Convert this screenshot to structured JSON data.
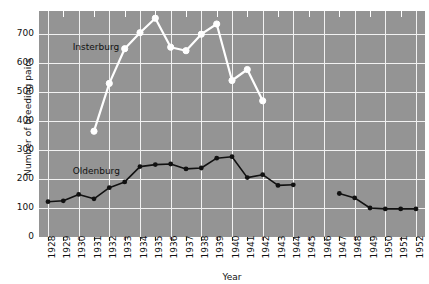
{
  "chart_data": {
    "type": "line",
    "title": "",
    "xlabel": "Year",
    "ylabel": "Number of breeding pairs",
    "xlim": [
      1928,
      1952
    ],
    "ylim": [
      0,
      780
    ],
    "yticks": [
      0,
      100,
      200,
      300,
      400,
      500,
      600,
      700
    ],
    "xticks": [
      1928,
      1929,
      1930,
      1931,
      1932,
      1933,
      1934,
      1935,
      1936,
      1937,
      1938,
      1939,
      1940,
      1941,
      1942,
      1943,
      1944,
      1945,
      1946,
      1947,
      1948,
      1949,
      1950,
      1951,
      1952
    ],
    "grid": true,
    "legend_position": "inline-annotation",
    "plot_background": "#949494",
    "gridline_color": "#f2f2f2",
    "series": [
      {
        "name": "Insterburg",
        "color": "#ffffff",
        "marker": "circle",
        "label_x": 1930,
        "label_y": 655,
        "x": [
          1931,
          1932,
          1933,
          1934,
          1935,
          1936,
          1937,
          1938,
          1939,
          1940,
          1941,
          1942,
          1943
        ],
        "values": [
          365,
          530,
          650,
          705,
          755,
          655,
          643,
          700,
          735,
          540,
          578,
          470,
          null
        ],
        "points": [
          {
            "year": 1931,
            "value": 365
          },
          {
            "year": 1932,
            "value": 530
          },
          {
            "year": 1933,
            "value": 650
          },
          {
            "year": 1934,
            "value": 705
          },
          {
            "year": 1935,
            "value": 755
          },
          {
            "year": 1936,
            "value": 655
          },
          {
            "year": 1937,
            "value": 643
          },
          {
            "year": 1938,
            "value": 700
          },
          {
            "year": 1939,
            "value": 735
          },
          {
            "year": 1940,
            "value": 540
          },
          {
            "year": 1941,
            "value": 578
          },
          {
            "year": 1942,
            "value": 470
          }
        ]
      },
      {
        "name": "Oldenburg",
        "color": "#111111",
        "marker": "dot",
        "label_x": 1930,
        "label_y": 228,
        "points": [
          {
            "year": 1928,
            "value": 122
          },
          {
            "year": 1929,
            "value": 125
          },
          {
            "year": 1930,
            "value": 147
          },
          {
            "year": 1931,
            "value": 132
          },
          {
            "year": 1932,
            "value": 170
          },
          {
            "year": 1933,
            "value": 190
          },
          {
            "year": 1934,
            "value": 243
          },
          {
            "year": 1935,
            "value": 250
          },
          {
            "year": 1936,
            "value": 252
          },
          {
            "year": 1937,
            "value": 235
          },
          {
            "year": 1938,
            "value": 238
          },
          {
            "year": 1939,
            "value": 272
          },
          {
            "year": 1940,
            "value": 277
          },
          {
            "year": 1941,
            "value": 205
          },
          {
            "year": 1942,
            "value": 215
          },
          {
            "year": 1943,
            "value": 178
          },
          {
            "year": 1944,
            "value": 180
          },
          {
            "year": 1947,
            "value": 150
          },
          {
            "year": 1948,
            "value": 135
          },
          {
            "year": 1949,
            "value": 100
          },
          {
            "year": 1950,
            "value": 97
          },
          {
            "year": 1951,
            "value": 97
          },
          {
            "year": 1952,
            "value": 97
          }
        ]
      }
    ]
  },
  "axis": {
    "y_title": "Number of breeding pairs",
    "x_title": "Year",
    "y_tick_labels": [
      "0",
      "100",
      "200",
      "300",
      "400",
      "500",
      "600",
      "700"
    ],
    "x_tick_labels": [
      "1928",
      "1929",
      "1930",
      "1931",
      "1932",
      "1933",
      "1934",
      "1935",
      "1936",
      "1937",
      "1938",
      "1939",
      "1940",
      "1941",
      "1942",
      "1943",
      "1944",
      "1945",
      "1946",
      "1947",
      "1948",
      "1949",
      "1950",
      "1951",
      "1952"
    ]
  },
  "annotations": {
    "insterburg": "Insterburg",
    "oldenburg": "Oldenburg"
  }
}
